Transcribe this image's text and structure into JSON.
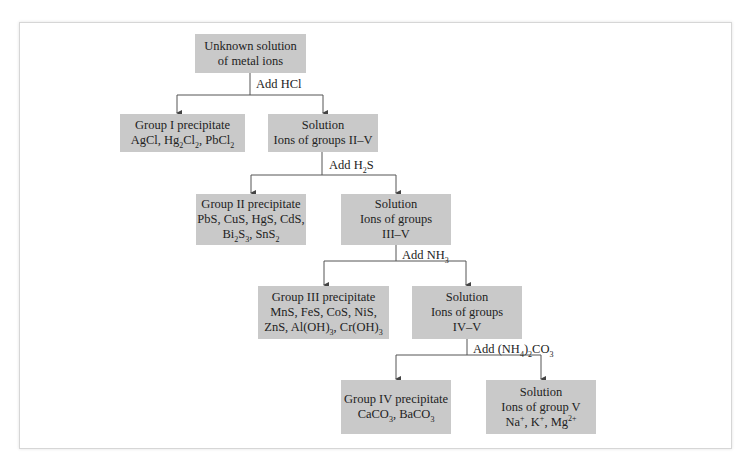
{
  "diagram": {
    "nodes": {
      "start": {
        "lines": [
          "Unknown solution",
          "of metal ions"
        ]
      },
      "group1": {
        "lines": [
          "Group I precipitate"
        ],
        "formula": "AgCl, Hg2Cl2, PbCl2"
      },
      "sol2": {
        "lines": [
          "Solution",
          "Ions of groups II–V"
        ]
      },
      "group2": {
        "lines": [
          "Group II precipitate",
          "PbS, CuS, HgS, CdS,"
        ],
        "formula": "Bi2S3, SnS2"
      },
      "sol3": {
        "lines": [
          "Solution",
          "Ions of groups",
          "III–V"
        ]
      },
      "group3": {
        "lines": [
          "Group III precipitate",
          "MnS, FeS, CoS, NiS,"
        ],
        "formula": "ZnS, Al(OH)3, Cr(OH)3"
      },
      "sol4": {
        "lines": [
          "Solution",
          "Ions of groups",
          "IV–V"
        ]
      },
      "group4": {
        "lines": [
          "Group IV precipitate"
        ],
        "formula": "CaCO3, BaCO3"
      },
      "sol5": {
        "lines": [
          "Solution",
          "Ions of group V"
        ],
        "formula": "Na+, K+, Mg2+"
      }
    },
    "reagents": {
      "r1": "Add HCl",
      "r2": "Add H2S",
      "r3": "Add NH3",
      "r4": "Add (NH4)2CO3"
    },
    "edges": [
      [
        "start",
        "group1"
      ],
      [
        "start",
        "sol2"
      ],
      [
        "sol2",
        "group2"
      ],
      [
        "sol2",
        "sol3"
      ],
      [
        "sol3",
        "group3"
      ],
      [
        "sol3",
        "sol4"
      ],
      [
        "sol4",
        "group4"
      ],
      [
        "sol4",
        "sol5"
      ]
    ],
    "colors": {
      "box_fill": "#c9c9c9",
      "line": "#444444",
      "frame_border": "#d6d6d6"
    }
  }
}
